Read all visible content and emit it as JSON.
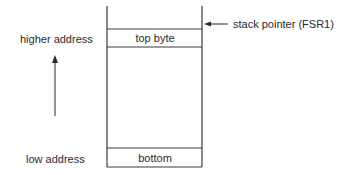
{
  "diagram": {
    "title": "",
    "labels": {
      "higher_address": "higher address",
      "low_address": "low address",
      "stack_pointer": "stack pointer (FSR1)"
    },
    "cells": {
      "top": "top byte",
      "bottom": "bottom"
    },
    "icons": {
      "direction_arrow": "arrow-up-icon",
      "pointer_arrow": "arrow-left-icon"
    },
    "colors": {
      "line": "#3a3a3a",
      "text": "#2a2a2a",
      "background": "#ffffff"
    }
  }
}
